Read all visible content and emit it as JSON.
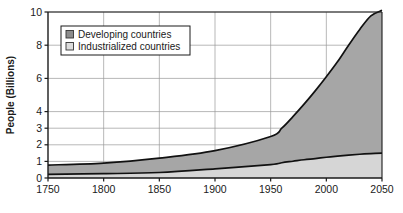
{
  "chart_data": {
    "type": "area",
    "title": "",
    "subtitle": "",
    "xlabel": "",
    "ylabel": "People (Billions)",
    "xlim": [
      1750,
      2050
    ],
    "ylim": [
      0,
      10
    ],
    "grid": true,
    "stacked": true,
    "legend_position": "top-left-inside",
    "x": [
      1750,
      1800,
      1850,
      1900,
      1950,
      1960,
      1970,
      1980,
      1990,
      2000,
      2010,
      2020,
      2030,
      2040,
      2050
    ],
    "xticks": [
      1750,
      1800,
      1850,
      1900,
      1950,
      2000,
      2050
    ],
    "xtick_labels": [
      "1750",
      "1800",
      "1850",
      "1900",
      "1950",
      "2000",
      "2050"
    ],
    "yticks": [
      0,
      1,
      2,
      3,
      4,
      6,
      8,
      10
    ],
    "ytick_labels": [
      "0",
      "1",
      "2",
      "3",
      "4",
      "6",
      "8",
      "10"
    ],
    "series": [
      {
        "name": "Industrialized countries",
        "color": "#d6d6d6",
        "values": [
          0.22,
          0.26,
          0.33,
          0.55,
          0.81,
          0.92,
          1.01,
          1.1,
          1.17,
          1.25,
          1.32,
          1.38,
          1.43,
          1.47,
          1.5
        ]
      },
      {
        "name": "Developing countries",
        "color": "#a6a6a6",
        "values": [
          0.56,
          0.64,
          0.87,
          1.1,
          1.69,
          2.08,
          2.69,
          3.35,
          4.08,
          4.85,
          5.68,
          6.62,
          7.52,
          8.3,
          8.6
        ]
      }
    ],
    "totals": [
      0.78,
      0.9,
      1.2,
      1.65,
      2.5,
      3.0,
      3.7,
      4.45,
      5.25,
      6.1,
      7.0,
      8.0,
      8.95,
      9.77,
      10.1
    ],
    "annotations": []
  },
  "legend": {
    "entries": [
      {
        "label": "Developing countries",
        "swatch_color": "#8c8c8c"
      },
      {
        "label": "Industrialized countries",
        "swatch_color": "#dcdcdc"
      }
    ]
  },
  "colors": {
    "background": "#ffffff",
    "axis": "#1a1a1a",
    "grid": "#9a9a9a",
    "developing_fill": "#a6a6a6",
    "industrialized_fill": "#d6d6d6",
    "curve": "#111111",
    "legend_border": "#1a1a1a",
    "legend_background": "#ffffff"
  }
}
